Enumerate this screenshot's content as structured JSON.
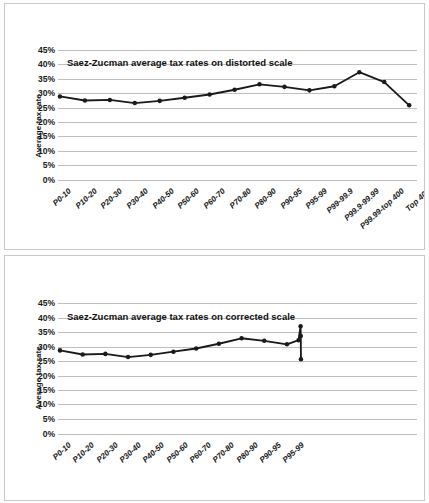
{
  "figure": {
    "panels": [
      {
        "id": "distorted",
        "title": "Saez-Zucman average tax rates on distorted scale"
      },
      {
        "id": "corrected",
        "title": "Saez-Zucman average tax rates on corrected scale"
      }
    ]
  },
  "axis": {
    "ylabel": "Average tax rate",
    "yticks": [
      "0%",
      "5%",
      "10%",
      "15%",
      "20%",
      "25%",
      "30%",
      "35%",
      "40%",
      "45%"
    ]
  },
  "colors": {
    "line": "#1a1a1a",
    "marker": "#1a1a1a",
    "grid": "#bfbfbf",
    "frame": "#c9c9c9",
    "background": "#ffffff",
    "text": "#1a1a1a"
  },
  "chart_data": [
    {
      "type": "line",
      "title": "Saez-Zucman average tax rates on distorted scale",
      "xlabel": "",
      "ylabel": "Average tax rate",
      "ylim": [
        0,
        45
      ],
      "ytick_step": 5,
      "grid": true,
      "legend": "none",
      "x_scale": "categorical-equal-width",
      "categories": [
        "P0-10",
        "P10-20",
        "P20-30",
        "P30-40",
        "P40-50",
        "P50-60",
        "P60-70",
        "P70-80",
        "P80-90",
        "P90-95",
        "P95-99",
        "P99-99.9",
        "P99.9-99.99",
        "P99.99-top 400",
        "Top 400"
      ],
      "values": [
        25.7,
        24.4,
        24.6,
        23.6,
        24.3,
        25.3,
        26.3,
        27.8,
        29.5,
        28.7,
        27.6,
        28.9,
        33.3,
        30.2,
        22.9
      ]
    },
    {
      "type": "line",
      "title": "Saez-Zucman average tax rates on corrected scale",
      "xlabel": "",
      "ylabel": "Average tax rate",
      "ylim": [
        0,
        45
      ],
      "ytick_step": 5,
      "grid": true,
      "legend": "none",
      "x_scale": "population-proportional",
      "note": "Top groups are compressed to their true population width, collapsing the last four points into a near-vertical spike after P95-99",
      "categories": [
        "P0-10",
        "P10-20",
        "P20-30",
        "P30-40",
        "P40-50",
        "P50-60",
        "P60-70",
        "P70-80",
        "P80-90",
        "P90-95",
        "P95-99",
        "P99-99.9",
        "P99.9-99.99",
        "P99.99-top 400",
        "Top 400"
      ],
      "visible_tick_labels": [
        "P0-10",
        "P10-20",
        "P20-30",
        "P30-40",
        "P40-50",
        "P50-60",
        "P60-70",
        "P70-80",
        "P80-90",
        "P90-95",
        "P95-99"
      ],
      "values": [
        25.7,
        24.4,
        24.6,
        23.6,
        24.3,
        25.3,
        26.3,
        27.8,
        29.5,
        28.7,
        27.6,
        28.9,
        33.3,
        30.2,
        22.9
      ],
      "x_positions_pct": [
        0,
        6.5,
        13,
        19.5,
        26,
        32.5,
        39,
        45.5,
        52,
        58.5,
        65,
        68.3,
        68.9,
        68.95,
        69.0
      ]
    }
  ]
}
